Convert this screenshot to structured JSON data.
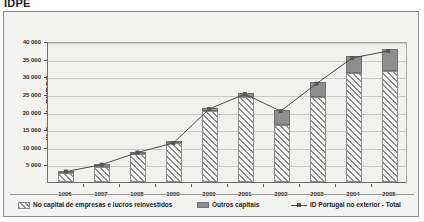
{
  "title": "IDPE",
  "axes": {
    "ylabel": "milhões de EUROS",
    "y_ticks": [
      "5 000",
      "10 000",
      "15 000",
      "20 000",
      "25 000",
      "30 000",
      "35 000",
      "40 000"
    ],
    "x_ticks": [
      "1996",
      "1997",
      "1998",
      "1999",
      "2000",
      "2001",
      "2002",
      "2003",
      "2004",
      "2005"
    ]
  },
  "legend": {
    "items": [
      {
        "label": "No capital de empresas e lucros reinvestidos",
        "marker": "hatched-swatch"
      },
      {
        "label": "Outros capitais",
        "marker": "solid-gray-swatch"
      },
      {
        "label": "ID Portugal no exterior - Total",
        "marker": "line-with-marker"
      }
    ]
  },
  "colors": {
    "series_hatch": "#8e8e8e",
    "series_solid": "#8e8e8e",
    "line": "#4a4a4a",
    "panel_background": "#f3f3f1",
    "plot_background": "#f1f1ef",
    "gridline": "#c9c9c7",
    "axis": "#6e6e6e"
  },
  "chart_data": {
    "type": "bar",
    "title": "IDPE",
    "xlabel": "",
    "ylabel": "milhões de EUROS",
    "ylim": [
      0,
      40000
    ],
    "ytick_step": 5000,
    "grid": true,
    "legend_position": "bottom",
    "categories": [
      "1996",
      "1997",
      "1998",
      "1999",
      "2000",
      "2001",
      "2002",
      "2003",
      "2004",
      "2005"
    ],
    "stacked": true,
    "series": [
      {
        "name": "No capital de empresas e lucros reinvestidos",
        "type": "bar-stacked-bottom",
        "values": [
          2500,
          4200,
          8000,
          11000,
          20200,
          24000,
          16300,
          24000,
          30800,
          31400
        ]
      },
      {
        "name": "Outros capitais",
        "type": "bar-stacked-top",
        "values": [
          500,
          800,
          500,
          200,
          800,
          1300,
          4100,
          4300,
          4900,
          6300
        ]
      },
      {
        "name": "ID Portugal no exterior - Total",
        "type": "line",
        "values": [
          3000,
          5000,
          8500,
          11200,
          21000,
          25300,
          20400,
          28300,
          35700,
          37700
        ]
      }
    ]
  }
}
